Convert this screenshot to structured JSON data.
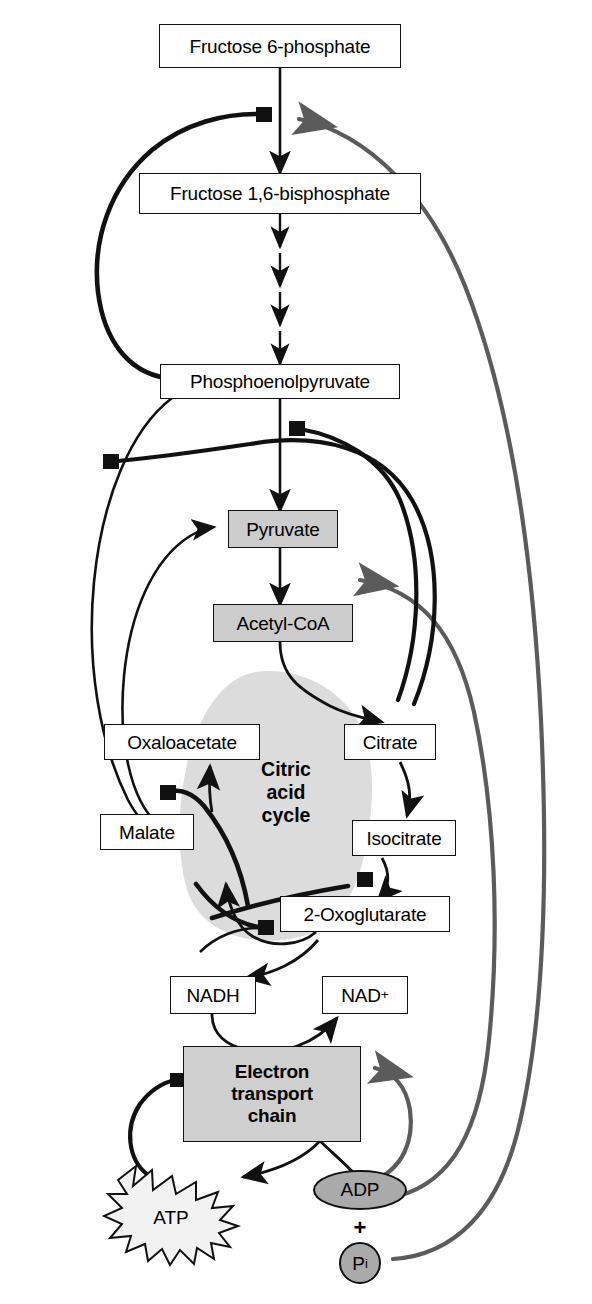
{
  "diagram": {
    "colors": {
      "stroke_black": "#111111",
      "stroke_gray": "#5b5b5b",
      "node_fill": "#ffffff",
      "shaded_fill": "#cccccc",
      "blob_fill": "#dcdcdc",
      "etc_fill": "#cfcfcf",
      "background": "#ffffff"
    },
    "cycle_label": {
      "line1": "Citric",
      "line2": "acid",
      "line3": "cycle"
    },
    "nodes": [
      {
        "id": "f6p",
        "label": "Fructose 6-phosphate",
        "style": "plain"
      },
      {
        "id": "f16bp",
        "label": "Fructose 1,6-bisphosphate",
        "style": "plain"
      },
      {
        "id": "pep",
        "label": "Phosphoenolpyruvate",
        "style": "plain"
      },
      {
        "id": "pyr",
        "label": "Pyruvate",
        "style": "shaded"
      },
      {
        "id": "accoa",
        "label": "Acetyl-CoA",
        "style": "shaded"
      },
      {
        "id": "oaa",
        "label": "Oxaloacetate",
        "style": "plain"
      },
      {
        "id": "cit",
        "label": "Citrate",
        "style": "plain"
      },
      {
        "id": "mal",
        "label": "Malate",
        "style": "plain"
      },
      {
        "id": "isocit",
        "label": "Isocitrate",
        "style": "plain"
      },
      {
        "id": "oxo",
        "label": "2-Oxoglutarate",
        "style": "plain"
      },
      {
        "id": "nadh",
        "label": "NADH",
        "style": "plain"
      },
      {
        "id": "nadp",
        "label": "NAD",
        "style": "plain",
        "superscript": "+"
      }
    ],
    "etc": {
      "line1": "Electron",
      "line2": "transport",
      "line3": "chain"
    },
    "metabolites": {
      "atp": "ATP",
      "adp": "ADP",
      "plus": "+",
      "pi_main": "P",
      "pi_sub": "i"
    },
    "legend_semantics": {
      "black_arrow": "reaction step",
      "black_bar_square": "inhibition",
      "gray_arrow": "activation"
    }
  }
}
